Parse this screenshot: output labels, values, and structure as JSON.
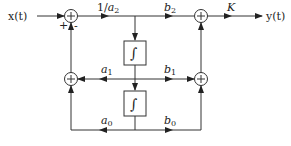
{
  "diagram": {
    "type": "block-diagram",
    "input_label": "x(t)",
    "output_label": "y(t)",
    "sum_signs": {
      "plus": "+",
      "minus": "-"
    },
    "gains": {
      "forward": "1/a2",
      "b2": "b2",
      "b1": "b1",
      "b0": "b0",
      "a1": "a1",
      "a0": "a0",
      "output": "K"
    },
    "integrator_symbol": "∫",
    "colors": {
      "line": "#333333",
      "background": "#ffffff"
    }
  }
}
